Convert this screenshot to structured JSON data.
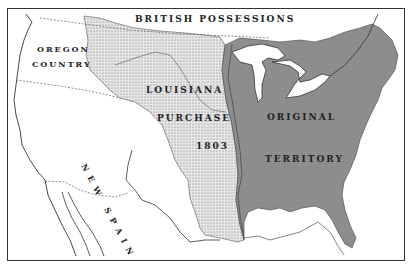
{
  "map": {
    "title": "Louisiana Purchase 1803",
    "colors": {
      "background": "#ffffff",
      "louisiana_purchase": "#d4d4d4",
      "original_territory": "#8f8f8f",
      "outline": "#333333",
      "water": "#ffffff"
    },
    "labels": {
      "british": "BRITISH POSSESSIONS",
      "oregon_1": "OREGON",
      "oregon_2": "COUNTRY",
      "louisiana_1": "LOUISIANA",
      "louisiana_2": "PURCHASE",
      "louisiana_3": "1803",
      "original_1": "ORIGINAL",
      "original_2": "TERRITORY",
      "new_spain": "NEW SPAIN"
    },
    "regions": [
      {
        "name": "British Possessions"
      },
      {
        "name": "Oregon Country"
      },
      {
        "name": "Louisiana Purchase",
        "year": "1803"
      },
      {
        "name": "Original Territory"
      },
      {
        "name": "New Spain"
      }
    ]
  }
}
